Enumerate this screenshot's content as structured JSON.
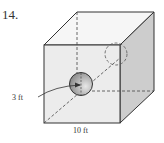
{
  "problem": {
    "number": "14.",
    "figure": "cube-with-sphere-through-diagonal",
    "labels": {
      "radius": "3 ft",
      "side": "10 ft"
    }
  },
  "colors": {
    "front_face": "#ededed",
    "right_face": "#cfcfcf",
    "top_face": "#f5f5f5",
    "edge": "#333333",
    "sphere_light": "#dddddd",
    "sphere_dark": "#8f8f8f"
  }
}
